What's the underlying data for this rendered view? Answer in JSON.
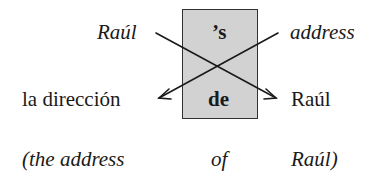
{
  "diagram": {
    "top_left": "Raúl",
    "top_right": "address",
    "box_top": "’s",
    "box_bottom": "de",
    "bottom_left": "la dirección",
    "bottom_right": "Raúl",
    "gloss": {
      "part1": "(the address",
      "part2": "of",
      "part3": "Raúl)"
    },
    "colors": {
      "box_fill": "#d2d2d2",
      "lines": "#1a1a1a"
    }
  }
}
